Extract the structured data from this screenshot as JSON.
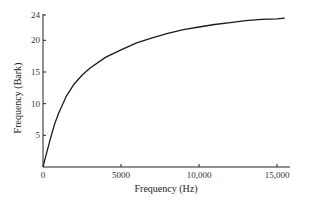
{
  "chart_data": {
    "type": "line",
    "title": "",
    "xlabel": "Frequency (Hz)",
    "ylabel": "Frequency (Bark)",
    "xlim": [
      0,
      15700
    ],
    "ylim": [
      0,
      24
    ],
    "grid": false,
    "legend": null,
    "x_ticks": [
      {
        "value": 0,
        "label": "0"
      },
      {
        "value": 5000,
        "label": "5000"
      },
      {
        "value": 10000,
        "label": "10,000"
      },
      {
        "value": 15000,
        "label": "15,000"
      }
    ],
    "y_ticks": [
      {
        "value": 5,
        "label": "5"
      },
      {
        "value": 10,
        "label": "10"
      },
      {
        "value": 15,
        "label": "15"
      },
      {
        "value": 20,
        "label": "20"
      },
      {
        "value": 24,
        "label": "24"
      }
    ],
    "series": [
      {
        "name": "Bark scale",
        "x": [
          0,
          100,
          250,
          500,
          750,
          1000,
          1500,
          2000,
          2500,
          3000,
          4000,
          5000,
          6000,
          7000,
          8000,
          9000,
          10000,
          11000,
          12000,
          13000,
          14000,
          15000,
          15500
        ],
        "y": [
          0.0,
          1.0,
          2.4,
          4.7,
          6.8,
          8.5,
          11.2,
          13.1,
          14.5,
          15.6,
          17.3,
          18.5,
          19.6,
          20.4,
          21.1,
          21.7,
          22.1,
          22.5,
          22.8,
          23.1,
          23.3,
          23.4,
          23.5
        ]
      }
    ],
    "line_color": "#1a1a1a"
  }
}
